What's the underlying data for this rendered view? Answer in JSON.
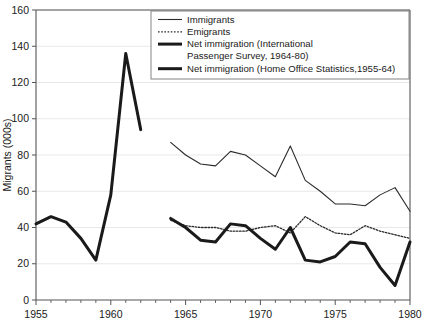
{
  "chart_data": {
    "type": "line",
    "title": "",
    "xlabel": "",
    "ylabel": "Migrants (000s)",
    "xlim": [
      1955,
      1980
    ],
    "ylim": [
      0,
      160
    ],
    "ytick_step": 20,
    "xtick_step": 5,
    "xminor_step": 1,
    "grid": true,
    "grid_axis": "y",
    "legend_position": "top-center",
    "ytick_labels": [
      "0",
      "20",
      "40",
      "60",
      "80",
      "100",
      "120",
      "140",
      "160"
    ],
    "ytick_values": [
      0,
      20,
      40,
      60,
      80,
      100,
      120,
      140,
      160
    ],
    "xtick_labels": [
      "1955",
      "1960",
      "1965",
      "1970",
      "1975",
      "1980"
    ],
    "xtick_values": [
      1955,
      1960,
      1965,
      1970,
      1975,
      1980
    ],
    "series": [
      {
        "name": "Immigrants",
        "style": "thin",
        "x": [
          1964,
          1965,
          1966,
          1967,
          1968,
          1969,
          1970,
          1971,
          1972,
          1973,
          1974,
          1975,
          1976,
          1977,
          1978,
          1979,
          1980
        ],
        "values": [
          87,
          80,
          75,
          74,
          82,
          80,
          74,
          68,
          85,
          66,
          60,
          53,
          53,
          52,
          58,
          62,
          49
        ]
      },
      {
        "name": "Emigrants",
        "style": "dotted",
        "x": [
          1964,
          1965,
          1966,
          1967,
          1968,
          1969,
          1970,
          1971,
          1972,
          1973,
          1974,
          1975,
          1976,
          1977,
          1978,
          1979,
          1980
        ],
        "values": [
          44,
          41,
          40,
          40,
          38,
          38,
          40,
          41,
          37,
          46,
          41,
          37,
          36,
          41,
          38,
          36,
          34
        ]
      },
      {
        "name": "Net immigration (International Passenger Survey, 1964-80)",
        "style": "thick",
        "x": [
          1964,
          1965,
          1966,
          1967,
          1968,
          1969,
          1970,
          1971,
          1972,
          1973,
          1974,
          1975,
          1976,
          1977,
          1978,
          1979,
          1980
        ],
        "values": [
          45,
          40,
          33,
          32,
          42,
          41,
          34,
          28,
          40,
          22,
          21,
          24,
          32,
          31,
          18,
          8,
          32
        ]
      },
      {
        "name": "Net immigration (Home Office Statistics,1955-64)",
        "style": "thick",
        "x": [
          1955,
          1956,
          1957,
          1958,
          1959,
          1960,
          1961,
          1962
        ],
        "values": [
          42,
          46,
          43,
          34,
          22,
          58,
          136,
          94
        ]
      }
    ],
    "legend_entries": [
      {
        "label": "Immigrants",
        "style": "thin"
      },
      {
        "label": "Emigrants",
        "style": "dotted"
      },
      {
        "label": "Net immigration (International",
        "style": "thick"
      },
      {
        "label": "Passenger Survey, 1964-80)",
        "style": "none"
      },
      {
        "label": "Net immigration (Home Office Statistics,1955-64)",
        "style": "thick"
      }
    ]
  },
  "colors": {
    "line": "#2b2b2b",
    "thick_line": "#1a1a1a",
    "axis": "#555555",
    "grid": "#e2e2e2",
    "background": "#ffffff"
  }
}
